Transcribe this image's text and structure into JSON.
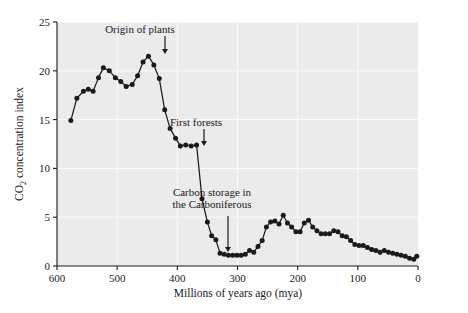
{
  "figure": {
    "background_color": "#ffffff",
    "plot_background_color": "#ebebeb",
    "line_color": "#1a1a1a",
    "gridline_color": "#ffffff"
  },
  "axes": {
    "y_title_main": "CO",
    "y_title_sub": "2",
    "y_title_rest": " concentration index",
    "x_title": "Millions of years ago (mya)",
    "y_ticks": [
      "0",
      "5",
      "10",
      "15",
      "20",
      "25"
    ],
    "x_ticks": [
      "600",
      "500",
      "400",
      "300",
      "200",
      "100",
      "0"
    ]
  },
  "annotations": [
    {
      "id": "origin-of-plants",
      "lines": [
        "Origin of plants"
      ],
      "text_x": 140,
      "text_y": 33,
      "arrow_x": 165,
      "arrow_y0": 36,
      "arrow_y1": 54
    },
    {
      "id": "first-forests",
      "lines": [
        "First forests"
      ],
      "text_x": 196,
      "text_y": 126,
      "arrow_x": 204,
      "arrow_y0": 129,
      "arrow_y1": 146
    },
    {
      "id": "carbon-storage",
      "lines": [
        "Carbon storage in",
        "the Carboniferous"
      ],
      "text_x": 212,
      "text_y": 196,
      "arrow_x": 228,
      "arrow_y0": 216,
      "arrow_y1": 252
    }
  ],
  "chart_data": {
    "type": "line",
    "title": "",
    "xlabel": "Millions of years ago (mya)",
    "ylabel": "CO2 concentration index",
    "xlim": [
      600,
      0
    ],
    "ylim": [
      0,
      25
    ],
    "x_reversed": true,
    "grid": true,
    "legend": null,
    "markers": "filled-circle",
    "annotations_text": [
      "Origin of plants",
      "First forests",
      "Carbon storage in the Carboniferous"
    ],
    "x": [
      577,
      567,
      556,
      548,
      540,
      531,
      523,
      513,
      503,
      494,
      485,
      475,
      466,
      457,
      448,
      439,
      430,
      421,
      412,
      403,
      395,
      386,
      377,
      368,
      359,
      350,
      343,
      336,
      329,
      322,
      315,
      308,
      301,
      294,
      287,
      280,
      273,
      266,
      259,
      252,
      245,
      238,
      231,
      224,
      217,
      210,
      203,
      196,
      189,
      182,
      175,
      168,
      161,
      154,
      147,
      140,
      133,
      126,
      119,
      112,
      105,
      98,
      91,
      84,
      77,
      70,
      63,
      56,
      49,
      42,
      35,
      28,
      21,
      14,
      7,
      2
    ],
    "y": [
      14.9,
      17.2,
      17.9,
      18.1,
      17.9,
      19.3,
      20.3,
      20.0,
      19.3,
      18.9,
      18.4,
      18.6,
      19.5,
      20.9,
      21.5,
      20.6,
      19.2,
      16.0,
      14.1,
      13.1,
      12.3,
      12.4,
      12.3,
      12.4,
      6.9,
      4.5,
      3.1,
      2.7,
      1.3,
      1.2,
      1.1,
      1.1,
      1.1,
      1.1,
      1.2,
      1.6,
      1.4,
      2.0,
      2.6,
      4.0,
      4.5,
      4.6,
      4.3,
      5.2,
      4.4,
      4.0,
      3.5,
      3.5,
      4.4,
      4.7,
      4.0,
      3.6,
      3.3,
      3.3,
      3.3,
      3.6,
      3.5,
      3.1,
      3.0,
      2.6,
      2.2,
      2.1,
      2.1,
      1.9,
      1.7,
      1.6,
      1.4,
      1.6,
      1.4,
      1.3,
      1.2,
      1.1,
      1.0,
      0.8,
      0.7,
      1.0
    ]
  }
}
